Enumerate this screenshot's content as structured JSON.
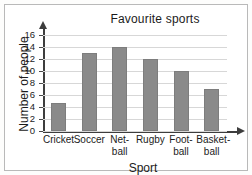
{
  "chart_data": {
    "type": "bar",
    "title": "Favourite sports",
    "xlabel": "Sport",
    "ylabel": "Number of people",
    "categories": [
      "Cricket",
      "Soccer",
      "Net-ball",
      "Rugby",
      "Foot-ball",
      "Basket-ball"
    ],
    "category_lines": [
      [
        "Cricket"
      ],
      [
        "Soccer"
      ],
      [
        "Net-",
        "ball"
      ],
      [
        "Rugby"
      ],
      [
        "Foot-",
        "ball"
      ],
      [
        "Basket-",
        "ball"
      ]
    ],
    "values": [
      4.7,
      13,
      14,
      12,
      10,
      7
    ],
    "ylim": [
      0,
      16
    ],
    "ytick_step": 2,
    "yticks": [
      16,
      14,
      12,
      10,
      8,
      6,
      4,
      2,
      0
    ],
    "grid": true,
    "legend": "none",
    "bar_color": "#8a8a8a",
    "axis_color": "#3d3d3d",
    "grid_color": "#d7d7d7"
  }
}
